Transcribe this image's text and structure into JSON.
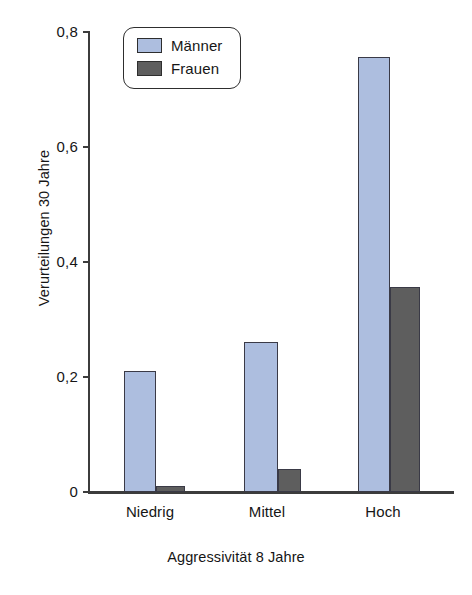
{
  "chart_data": {
    "type": "bar",
    "title": "",
    "categories": [
      "Niedrig",
      "Mittel",
      "Hoch"
    ],
    "series": [
      {
        "name": "Männer",
        "color": "#adbedf",
        "values": [
          0.21,
          0.26,
          0.755
        ]
      },
      {
        "name": "Frauen",
        "color": "#5e5e5e",
        "values": [
          0.01,
          0.04,
          0.355
        ]
      }
    ],
    "xlabel": "Aggressivität 8 Jahre",
    "ylabel": "Verurteilungen 30 Jahre",
    "ylim": [
      0,
      0.8
    ],
    "yticks": [
      0,
      0.2,
      0.4,
      0.6,
      0.8
    ],
    "ytick_labels": [
      "0",
      "0,2",
      "0,4",
      "0,6",
      "0,8"
    ],
    "grid": false,
    "legend_position": "top-left",
    "decimal_separator": ","
  },
  "axes": {
    "y_title": "Verurteilungen 30 Jahre",
    "x_title": "Aggressivität 8 Jahre"
  },
  "legend": {
    "entries": [
      {
        "label": "Männer",
        "swatch": "male-color-swatch"
      },
      {
        "label": "Frauen",
        "swatch": "female-color-swatch"
      }
    ]
  },
  "colors": {
    "male": "#adbedf",
    "female": "#5e5e5e",
    "axis": "#3c3c3c",
    "text": "#161616",
    "background": "#ffffff"
  }
}
